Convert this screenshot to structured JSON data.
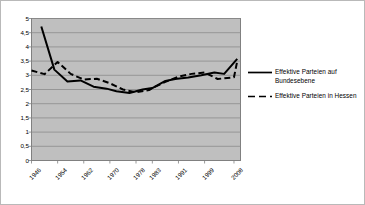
{
  "chart_data": {
    "type": "line",
    "title": "",
    "subtitle": "",
    "xlabel": "",
    "ylabel": "",
    "ylim": [
      0,
      5
    ],
    "ytick_step": 0.5,
    "grid": true,
    "grid_axis": "y",
    "legend_position": "right",
    "plot_background": "#bfbfbf",
    "line_color": "#000000",
    "decimal_separator": ",",
    "ytick_labels": [
      "5",
      "4,5",
      "4",
      "3,5",
      "3",
      "2,5",
      "2",
      "1,5",
      "1",
      "0,5",
      "0"
    ],
    "ytick_values": [
      5,
      4.5,
      4,
      3.5,
      3,
      2.5,
      2,
      1.5,
      1,
      0.5,
      0
    ],
    "xtick_labels": [
      "1946",
      "1954",
      "1962",
      "1970",
      "1978",
      "1983",
      "1991",
      "1999",
      "2008"
    ],
    "xtick_values": [
      1946,
      1954,
      1962,
      1970,
      1978,
      1983,
      1991,
      1999,
      2008
    ],
    "xlim": [
      1946,
      2010
    ],
    "series": [
      {
        "name": "Effektive Parteien auf Bundesebene",
        "style": "solid",
        "color": "#000000",
        "x": [
          1949,
          1953,
          1957,
          1961,
          1965,
          1969,
          1972,
          1976,
          1980,
          1983,
          1987,
          1990,
          1994,
          1998,
          2002,
          2005,
          2009
        ],
        "values": [
          4.72,
          3.2,
          2.78,
          2.82,
          2.6,
          2.53,
          2.44,
          2.38,
          2.5,
          2.55,
          2.8,
          2.87,
          2.92,
          3.0,
          3.1,
          3.05,
          3.58
        ]
      },
      {
        "name": "Effektive Parteien in Hessen",
        "style": "dashed",
        "color": "#000000",
        "x": [
          1946,
          1950,
          1954,
          1958,
          1962,
          1966,
          1970,
          1974,
          1978,
          1982,
          1983,
          1987,
          1991,
          1995,
          1999,
          2003,
          2008,
          2009
        ],
        "values": [
          3.17,
          3.04,
          3.47,
          3.05,
          2.85,
          2.88,
          2.72,
          2.5,
          2.4,
          2.48,
          2.55,
          2.77,
          2.95,
          3.05,
          3.1,
          2.87,
          2.93,
          3.5
        ]
      }
    ]
  },
  "legend": {
    "items": [
      {
        "label": "Effektive Parteien auf Bundesebene",
        "style": "solid"
      },
      {
        "label": "Effektive Parteien in Hessen",
        "style": "dashed"
      }
    ]
  }
}
